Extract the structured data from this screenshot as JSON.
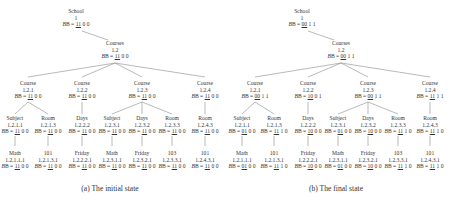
{
  "panels": [
    {
      "caption": "(a) The initial state",
      "b_prefix": "B = ",
      "nodes": {
        "school": {
          "label": "School",
          "id": "1",
          "b_u": "11",
          "b_rest": " 0 0"
        },
        "courses": {
          "label": "Courses",
          "id": "1.2",
          "b_u": "11",
          "b_rest": " 0 0"
        },
        "c1": {
          "label": "Course",
          "id": "1.2.1",
          "b_u": "11",
          "b_rest": " 0 0"
        },
        "c2": {
          "label": "Course",
          "id": "1.2.2",
          "b_u": "11",
          "b_rest": " 0 0"
        },
        "c3": {
          "label": "Course",
          "id": "1.2.3",
          "b_u": "11",
          "b_rest": " 0 0"
        },
        "c4": {
          "label": "Course",
          "id": "1.2.4",
          "b_u": "11",
          "b_rest": " 0 0"
        },
        "c1s": {
          "label": "Subject",
          "id": "1.2.1.1",
          "b_u": "11",
          "b_rest": " 0 0"
        },
        "c1r": {
          "label": "Room",
          "id": "1.2.1.3",
          "b_u": "11",
          "b_rest": " 0 0"
        },
        "c2d": {
          "label": "Days",
          "id": "1.2.2.2",
          "b_u": "11",
          "b_rest": " 0 0"
        },
        "c3s": {
          "label": "Subject",
          "id": "1.2.3.1",
          "b_u": "11",
          "b_rest": " 0 0"
        },
        "c3d": {
          "label": "Days",
          "id": "1.2.3.2",
          "b_u": "11",
          "b_rest": " 0 0"
        },
        "c3r": {
          "label": "Room",
          "id": "1.2.3.3",
          "b_u": "11",
          "b_rest": " 0 0"
        },
        "c4r": {
          "label": "Room",
          "id": "1.2.4.3",
          "b_u": "11",
          "b_rest": " 0 0"
        },
        "l1": {
          "label": "Math",
          "id": "1.2.1.1.1",
          "b_u": "11",
          "b_rest": " 0 0"
        },
        "l2": {
          "label": "101",
          "id": "1.2.1.3.1",
          "b_u": "11",
          "b_rest": " 0 0"
        },
        "l3": {
          "label": "Friday",
          "id": "1.2.2.2.1",
          "b_u": "11",
          "b_rest": " 0 0"
        },
        "l4": {
          "label": "Math",
          "id": "1.2.3.1.1",
          "b_u": "11",
          "b_rest": " 0 0"
        },
        "l5": {
          "label": "Friday",
          "id": "1.2.3.2.1",
          "b_u": "11",
          "b_rest": " 0 0"
        },
        "l6": {
          "label": "103",
          "id": "1.2.3.3.1",
          "b_u": "11",
          "b_rest": " 0 0"
        },
        "l7": {
          "label": "101",
          "id": "1.2.4.3.1",
          "b_u": "11",
          "b_rest": " 0 0"
        }
      }
    },
    {
      "caption": "(b) The final state",
      "b_prefix": "B = ",
      "nodes": {
        "school": {
          "label": "School",
          "id": "1",
          "b_u": "00",
          "b_rest": " 1 1"
        },
        "courses": {
          "label": "Courses",
          "id": "1.2",
          "b_u": "00",
          "b_rest": " 1 1"
        },
        "c1": {
          "label": "Course",
          "id": "1.2.1",
          "b_u": "00",
          "b_rest": " 1 1"
        },
        "c2": {
          "label": "Course",
          "id": "1.2.2",
          "b_u": "10",
          "b_rest": " 0 1"
        },
        "c3": {
          "label": "Course",
          "id": "1.2.3",
          "b_u": "00",
          "b_rest": " 1 1"
        },
        "c4": {
          "label": "Course",
          "id": "1.2.4",
          "b_u": "11",
          "b_rest": " 1 1"
        },
        "c1s": {
          "label": "Subject",
          "id": "1.2.1.1",
          "b_u": "01",
          "b_rest": " 0 0"
        },
        "c1r": {
          "label": "Room",
          "id": "1.2.1.3",
          "b_u": "11",
          "b_rest": " 1 0"
        },
        "c2d": {
          "label": "Days",
          "id": "1.2.2.2",
          "b_u": "10",
          "b_rest": " 0 0"
        },
        "c3s": {
          "label": "Subject",
          "id": "1.2.3.1",
          "b_u": "01",
          "b_rest": " 0 0"
        },
        "c3d": {
          "label": "Days",
          "id": "1.2.3.2",
          "b_u": "10",
          "b_rest": " 0 0"
        },
        "c3r": {
          "label": "Room",
          "id": "1.2.3.3",
          "b_u": "11",
          "b_rest": " 1 0"
        },
        "c4r": {
          "label": "Room",
          "id": "1.2.4.3",
          "b_u": "11",
          "b_rest": " 1 0"
        },
        "l1": {
          "label": "Math",
          "id": "1.2.1.1.1",
          "b_u": "01",
          "b_rest": " 0 0"
        },
        "l2": {
          "label": "101",
          "id": "1.2.1.3.1",
          "b_u": "11",
          "b_rest": " 1 0"
        },
        "l3": {
          "label": "Friday",
          "id": "1.2.2.2.1",
          "b_u": "10",
          "b_rest": " 0 0"
        },
        "l4": {
          "label": "Math",
          "id": "1.2.3.1.1",
          "b_u": "01",
          "b_rest": " 0 0"
        },
        "l5": {
          "label": "Friday",
          "id": "1.2.3.2.1",
          "b_u": "10",
          "b_rest": " 0 0"
        },
        "l6": {
          "label": "103",
          "id": "1.2.3.3.1",
          "b_u": "11",
          "b_rest": " 1 0"
        },
        "l7": {
          "label": "101",
          "id": "1.2.4.3.1",
          "b_u": "11",
          "b_rest": " 1 0"
        }
      }
    }
  ]
}
